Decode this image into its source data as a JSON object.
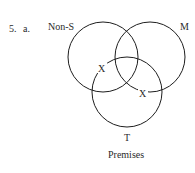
{
  "problem": {
    "number": "5.",
    "part": "a."
  },
  "diagram": {
    "type": "venn-three-circle",
    "caption": "Premises",
    "circles": [
      {
        "id": "non-s",
        "label": "Non-S",
        "cx": 103,
        "cy": 57,
        "r": 35
      },
      {
        "id": "m",
        "label": "M",
        "cx": 150,
        "cy": 57,
        "r": 35
      },
      {
        "id": "t",
        "label": "T",
        "cx": 127,
        "cy": 92,
        "r": 35
      }
    ],
    "marks": [
      {
        "id": "x1",
        "text": "X",
        "x": 102,
        "y": 72
      },
      {
        "id": "x2",
        "text": "X",
        "x": 143,
        "y": 97
      }
    ]
  }
}
